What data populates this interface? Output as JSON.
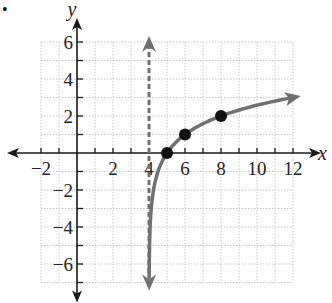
{
  "bullet": "•",
  "chart_data": {
    "type": "line",
    "title": "",
    "xlabel": "x",
    "ylabel": "y",
    "xlim": [
      -2,
      12
    ],
    "ylim": [
      -7,
      6
    ],
    "grid": true,
    "x_ticks": [
      -2,
      2,
      4,
      6,
      8,
      10,
      12
    ],
    "x_tick_labels": [
      "−2",
      "2",
      "4",
      "6",
      "8",
      "10",
      "12"
    ],
    "y_ticks": [
      6,
      4,
      2,
      -2,
      -4,
      -6
    ],
    "y_tick_labels": [
      "6",
      "4",
      "2",
      "−2",
      "−4",
      "−6"
    ],
    "asymptote": {
      "type": "vertical",
      "x": 4,
      "style": "dashed",
      "color": "#707070"
    },
    "curve": {
      "description": "y = log2(x - 4)",
      "color": "#707070",
      "x": [
        4.008,
        4.03,
        4.06,
        4.125,
        4.25,
        4.5,
        5,
        6,
        8,
        10,
        12
      ],
      "y": [
        -7,
        -5.06,
        -4.06,
        -3,
        -2,
        -1,
        0,
        1,
        2,
        2.58,
        3
      ]
    },
    "points": [
      {
        "x": 5,
        "y": 0
      },
      {
        "x": 6,
        "y": 1
      },
      {
        "x": 8,
        "y": 2
      }
    ],
    "colors": {
      "axis": "#1a1a1a",
      "grid": "#c8c8c8",
      "curve": "#707070",
      "points": "#111111"
    }
  }
}
